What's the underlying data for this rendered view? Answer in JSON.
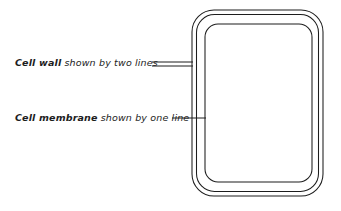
{
  "figure": {
    "background_color": "#ffffff",
    "ink_color": "#1d1d1d",
    "width": 341,
    "height": 211
  },
  "labels": [
    {
      "id": "cell-wall",
      "term": "Cell wall",
      "rest": " shown by two lines",
      "leader_style": "double-line"
    },
    {
      "id": "cell-membrane",
      "term": "Cell membrane",
      "rest": " shown by one line",
      "leader_style": "single-line"
    }
  ],
  "cell": {
    "name": "plant-cell-outline",
    "wall_outer": {
      "x": 192,
      "y": 10,
      "width": 131,
      "height": 186,
      "radius": 22
    },
    "wall_inner": {
      "x": 196,
      "y": 14,
      "width": 123,
      "height": 178,
      "radius": 19
    },
    "membrane": {
      "x": 205,
      "y": 24,
      "width": 107,
      "height": 158,
      "radius": 13
    }
  },
  "leaders": {
    "cell_wall": {
      "x_start": 152,
      "x_end": 193,
      "y_top": 62,
      "y_bottom": 66
    },
    "cell_membrane": {
      "x_start": 172,
      "x_end": 206,
      "y": 118
    }
  }
}
